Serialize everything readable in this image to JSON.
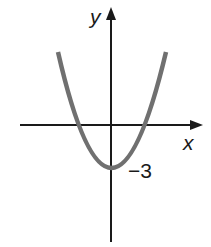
{
  "diagram": {
    "type": "function-graph",
    "axes": {
      "x_label": "x",
      "y_label": "y"
    },
    "annotations": {
      "y_intercept_label": "−3"
    },
    "curve": {
      "shape": "parabola",
      "opens": "up",
      "vertex": [
        0,
        -3
      ],
      "color": "#707070"
    },
    "axis_color": "#1a1a1a"
  }
}
